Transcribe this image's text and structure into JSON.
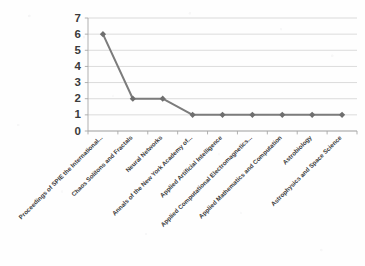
{
  "chart_data": {
    "type": "line",
    "title": "",
    "subtitle": "",
    "xlabel": "",
    "ylabel": "",
    "categories": [
      "Proceedings of SPIE the International...",
      "Chaos Solitons and Fractals",
      "Neural Networks",
      "Annals of the New York Academy of...",
      "Applied Artificial Intelligence",
      "Applied Computational Electromagnetics...",
      "Applied Mathematics and Computation",
      "Astrobiology",
      "Astrophysics and Space Science"
    ],
    "values": [
      6,
      2,
      2,
      1,
      1,
      1,
      1,
      1,
      1
    ],
    "series": [
      {
        "name": "",
        "values": [
          6,
          2,
          2,
          1,
          1,
          1,
          1,
          1,
          1
        ]
      }
    ],
    "ylim": [
      0,
      7
    ],
    "y_ticks": [
      0,
      1,
      2,
      3,
      4,
      5,
      6,
      7
    ],
    "y_tick_labels": [
      "0",
      "1",
      "2",
      "3",
      "4",
      "5",
      "6",
      "7"
    ],
    "grid": true,
    "grid_axis": "y",
    "legend": false,
    "legend_position": "none",
    "x_tick_label_rotation": 45,
    "marker": "diamond"
  },
  "style": {
    "line_color": "#7c7c7c",
    "marker_color": "#6e6e6e",
    "grid_color": "#d2d2d2",
    "axis_color": "#a8a8a8",
    "tick_label_color": "#3b3b3b",
    "background_color": "#fefefe"
  }
}
